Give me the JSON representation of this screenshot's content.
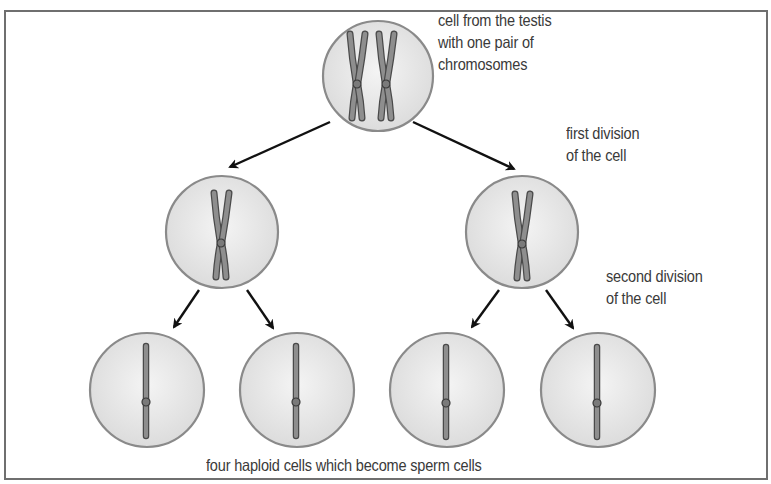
{
  "diagram": {
    "labels": {
      "parent_cell": [
        "cell from the testis",
        "with one pair of",
        "chromosomes"
      ],
      "first_division": [
        "first division",
        "of the cell"
      ],
      "second_division": [
        "second division",
        "of the cell"
      ],
      "caption": "four haploid cells which become sperm cells"
    },
    "nodes": [
      {
        "id": "parent",
        "label": "cell from the testis with one pair of chromosomes",
        "cx": 378,
        "cy": 76,
        "r": 55,
        "chromosomes": "2 duplicated (X-shaped)"
      },
      {
        "id": "daughter-left",
        "cx": 222,
        "cy": 232,
        "r": 56,
        "chromosomes": "1 duplicated (X-shaped)"
      },
      {
        "id": "daughter-right",
        "cx": 522,
        "cy": 232,
        "r": 56,
        "chromosomes": "1 duplicated (X-shaped)"
      },
      {
        "id": "sperm-1",
        "cx": 147,
        "cy": 390,
        "r": 57,
        "chromosomes": "1 single"
      },
      {
        "id": "sperm-2",
        "cx": 297,
        "cy": 390,
        "r": 57,
        "chromosomes": "1 single"
      },
      {
        "id": "sperm-3",
        "cx": 447,
        "cy": 390,
        "r": 57,
        "chromosomes": "1 single"
      },
      {
        "id": "sperm-4",
        "cx": 598,
        "cy": 390,
        "r": 57,
        "chromosomes": "1 single"
      }
    ],
    "edges": [
      {
        "from": "parent",
        "to": "daughter-left",
        "stage": "first division"
      },
      {
        "from": "parent",
        "to": "daughter-right",
        "stage": "first division"
      },
      {
        "from": "daughter-left",
        "to": "sperm-1",
        "stage": "second division"
      },
      {
        "from": "daughter-left",
        "to": "sperm-2",
        "stage": "second division"
      },
      {
        "from": "daughter-right",
        "to": "sperm-3",
        "stage": "second division"
      },
      {
        "from": "daughter-right",
        "to": "sperm-4",
        "stage": "second division"
      }
    ],
    "colors": {
      "frame": "#6f6f6f",
      "cell_fill": "#e4e4e4",
      "cell_edge": "#8a8a8a",
      "chromosome_fill": "#8e8e8e",
      "chromosome_edge": "#4a4a4a",
      "arrow": "#111111",
      "text": "#3a3a3a"
    }
  }
}
